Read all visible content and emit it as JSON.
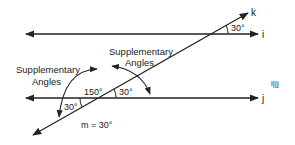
{
  "diagram": {
    "lines": {
      "i": "i",
      "j": "j",
      "k": "k"
    },
    "parallel_note": "i||j",
    "angles": {
      "top_right": "30°",
      "middle_right": "30°",
      "middle_left": "150°",
      "bottom_left": "30°"
    },
    "labels": {
      "supp_left_line1": "Supplementary",
      "supp_left_line2": "Angles",
      "supp_right_line1": "Supplementary",
      "supp_right_line2": "Angles"
    },
    "equation": "m = 30°",
    "colors": {
      "stroke": "#222222"
    }
  }
}
